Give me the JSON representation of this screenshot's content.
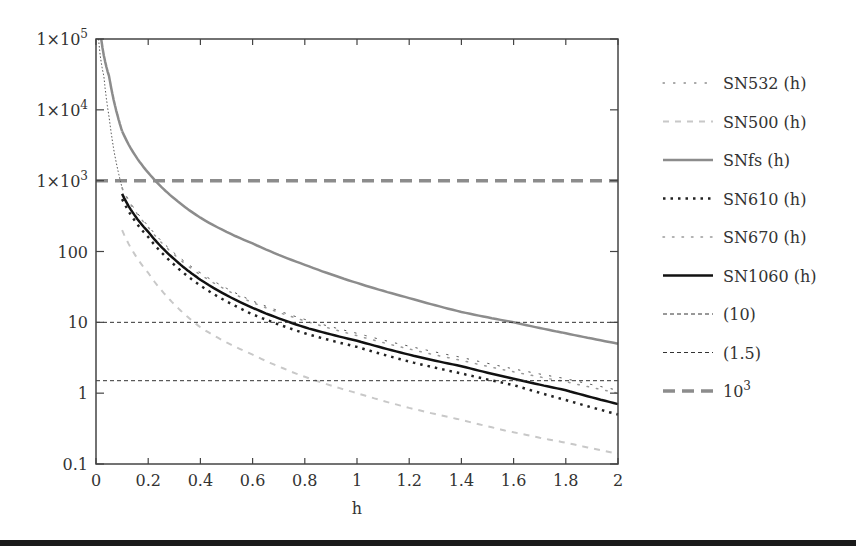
{
  "chart_data": {
    "type": "line",
    "title": "",
    "xlabel": "h",
    "ylabel": "",
    "xscale": "linear",
    "yscale": "log",
    "xlim": [
      0,
      2
    ],
    "ylim": [
      0.1,
      100000
    ],
    "grid": false,
    "legend_position": "right",
    "x_ticks": [
      0,
      0.2,
      0.4,
      0.6,
      0.8,
      1,
      1.2,
      1.4,
      1.6,
      1.8,
      2
    ],
    "x_tick_labels": [
      "0",
      "0.2",
      "0.4",
      "0.6",
      "0.8",
      "1",
      "1.2",
      "1.4",
      "1.6",
      "1.8",
      "2"
    ],
    "y_ticks": [
      0.1,
      1,
      10,
      100,
      1000,
      10000,
      100000
    ],
    "y_tick_labels": [
      "0.1",
      "1",
      "10",
      "100",
      "1×10³",
      "1×10⁴",
      "1×10⁵"
    ],
    "x": [
      0.1,
      0.2,
      0.3,
      0.4,
      0.6,
      0.8,
      1.0,
      1.2,
      1.4,
      1.6,
      1.8,
      2.0
    ],
    "series": [
      {
        "name": "SN532 (h)",
        "style": "dotted-sparse",
        "color": "#555555",
        "width": 1,
        "values": [
          800,
          230,
          95,
          50,
          20,
          11,
          7,
          4.6,
          3.2,
          2.2,
          1.6,
          1.1
        ]
      },
      {
        "name": "SN500 (h)",
        "style": "dashed-light",
        "color": "#c8c8c8",
        "width": 2,
        "values": [
          200,
          50,
          18,
          8.5,
          3.5,
          1.7,
          1.0,
          0.62,
          0.42,
          0.28,
          0.2,
          0.14
        ]
      },
      {
        "name": "SNfs (h)",
        "style": "solid",
        "color": "#8c8c8c",
        "width": 2.5,
        "values": [
          5000,
          1300,
          560,
          300,
          130,
          65,
          36,
          22,
          14,
          10,
          7,
          5
        ]
      },
      {
        "name": "SN610 (h)",
        "style": "dotted-bold",
        "color": "#222222",
        "width": 2.5,
        "values": [
          550,
          160,
          65,
          33,
          13,
          7,
          4.5,
          2.8,
          1.9,
          1.3,
          0.8,
          0.5
        ]
      },
      {
        "name": "SN670 (h)",
        "style": "dotted-sparse-light",
        "color": "#999999",
        "width": 1.5,
        "values": [
          780,
          220,
          90,
          47,
          19,
          10.5,
          6.5,
          4.2,
          2.9,
          2.0,
          1.45,
          1.0
        ]
      },
      {
        "name": "SN1060 (h)",
        "style": "solid-bold",
        "color": "#111111",
        "width": 2.5,
        "values": [
          650,
          190,
          78,
          40,
          16,
          8.5,
          5.5,
          3.5,
          2.4,
          1.6,
          1.1,
          0.7
        ]
      },
      {
        "name": "(10)",
        "style": "dashed-thin",
        "color": "#333333",
        "width": 1,
        "values": [
          10,
          10,
          10,
          10,
          10,
          10,
          10,
          10,
          10,
          10,
          10,
          10
        ]
      },
      {
        "name": "(1.5)",
        "style": "dashed-thin",
        "color": "#333333",
        "width": 1,
        "values": [
          1.5,
          1.5,
          1.5,
          1.5,
          1.5,
          1.5,
          1.5,
          1.5,
          1.5,
          1.5,
          1.5,
          1.5
        ]
      },
      {
        "name": "10³",
        "style": "dashed-thick",
        "color": "#8c8c8c",
        "width": 3.5,
        "values": [
          1000,
          1000,
          1000,
          1000,
          1000,
          1000,
          1000,
          1000,
          1000,
          1000,
          1000,
          1000
        ]
      }
    ],
    "extra_curves_near_origin": [
      {
        "name": "SN532 (h) continuation",
        "x": [
          0.01,
          0.03,
          0.05,
          0.07,
          0.1
        ],
        "values": [
          100000,
          30000,
          8000,
          2500,
          800
        ]
      },
      {
        "name": "SNfs (h) continuation",
        "x": [
          0.02,
          0.05,
          0.08,
          0.1
        ],
        "values": [
          100000,
          30000,
          9000,
          5000
        ]
      }
    ]
  },
  "legend": {
    "items": [
      {
        "label": "SN532 (h)"
      },
      {
        "label": "SN500 (h)"
      },
      {
        "label": "SNfs (h)"
      },
      {
        "label": "SN610 (h)"
      },
      {
        "label": "SN670 (h)"
      },
      {
        "label": "SN1060 (h)"
      },
      {
        "label": "(10)"
      },
      {
        "label": "(1.5)"
      },
      {
        "label": "10³"
      }
    ]
  },
  "axis": {
    "xlabel": "h"
  }
}
